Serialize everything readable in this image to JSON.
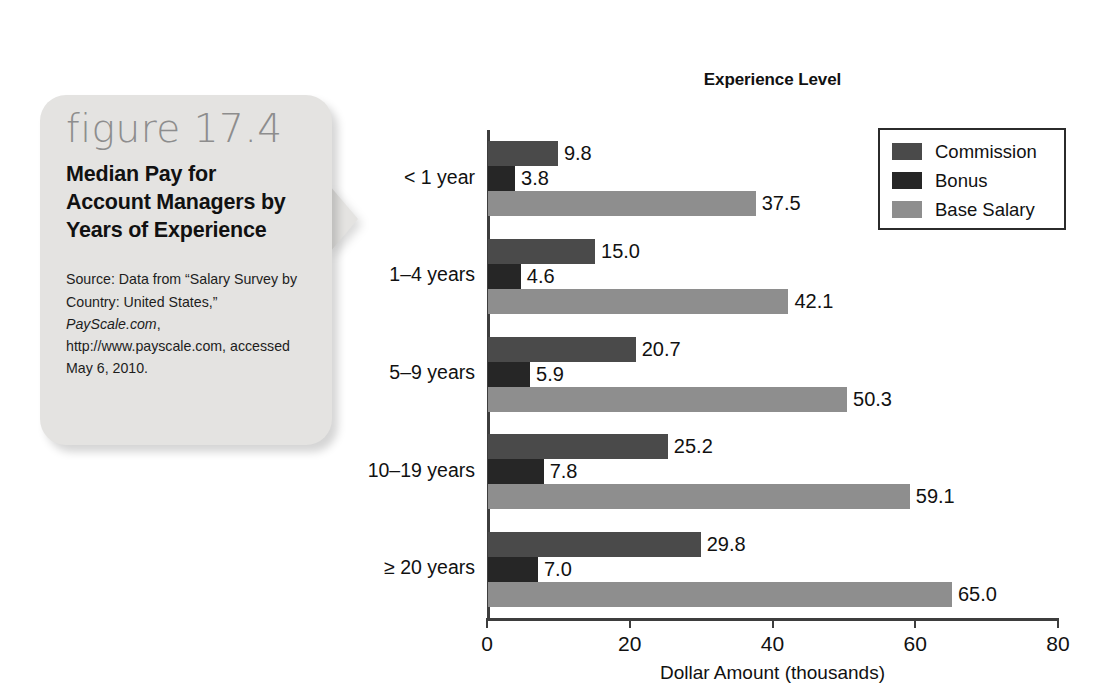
{
  "figure": {
    "number_label": "figure 17.4",
    "title": "Median Pay for Account Managers by Years of Experience",
    "source_prefix": "Source: Data from “Salary Survey by Country: United States,” ",
    "source_italic": "PayScale.com",
    "source_suffix": ", http://www.payscale.com, accessed May 6, 2010."
  },
  "chart_data": {
    "type": "bar",
    "orientation": "horizontal",
    "title": "Experience Level",
    "xlabel": "Dollar Amount (thousands)",
    "ylabel": "",
    "xlim": [
      0,
      80
    ],
    "xticks": [
      0,
      20,
      40,
      60,
      80
    ],
    "xtick_labels": [
      "0",
      "20",
      "40",
      "60",
      "80"
    ],
    "grid": false,
    "legend_position": "top-right",
    "categories": [
      "< 1 year",
      "1–4 years",
      "5–9 years",
      "10–19 years",
      "≥ 20 years"
    ],
    "series": [
      {
        "name": "Commission",
        "color": "#4a4a4a",
        "values": [
          9.8,
          15.0,
          20.7,
          25.2,
          29.8
        ],
        "labels": [
          "9.8",
          "15.0",
          "20.7",
          "25.2",
          "29.8"
        ]
      },
      {
        "name": "Bonus",
        "color": "#262626",
        "values": [
          3.8,
          4.6,
          5.9,
          7.8,
          7.0
        ],
        "labels": [
          "3.8",
          "4.6",
          "5.9",
          "7.8",
          "7.0"
        ]
      },
      {
        "name": "Base Salary",
        "color": "#8e8e8e",
        "values": [
          37.5,
          42.1,
          50.3,
          59.1,
          65.0
        ],
        "labels": [
          "37.5",
          "42.1",
          "50.3",
          "59.1",
          "65.0"
        ]
      }
    ]
  }
}
